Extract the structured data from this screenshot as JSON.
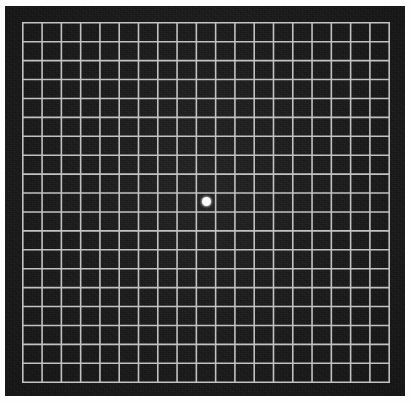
{
  "document": {
    "title": "Amsler Grid",
    "type": "amsler-grid-chart",
    "description": "Amsler grid: a square white-lined grid on a black background with a central white fixation dot, used for testing central visual field distortion.",
    "background_color": "#ffffff",
    "panel_color": "#191919",
    "grid_line_color": "#c2c2c2",
    "fixation_dot_color": "#fbfbfb"
  },
  "chart_data": {
    "type": "grid",
    "title": "Amsler Grid",
    "columns": 19,
    "rows": 19,
    "cell_size_px": 19.3,
    "grid_width_px": 367,
    "grid_height_px": 360,
    "grid_origin": {
      "x": 22,
      "y": 22
    },
    "line_width_px": 1.6,
    "line_color": "#c2c2c2",
    "background_color": "#191919",
    "fixation_point": {
      "label": "central fixation dot",
      "x": 206,
      "y": 201,
      "diameter_px": 9,
      "color": "#fbfbfb"
    },
    "border": {
      "outer_margin_px": 5,
      "bezel_color": "#191919",
      "bezel_width_px": 17
    }
  },
  "labels": {
    "fixation_dot": "Central fixation dot",
    "grid": "Amsler grid lines",
    "panel": "Black chart field",
    "page": "White page margin"
  }
}
